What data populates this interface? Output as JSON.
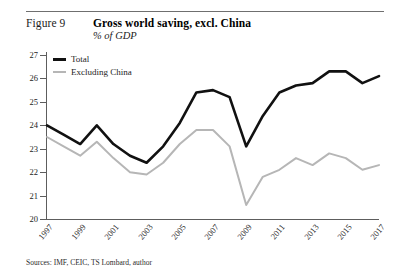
{
  "header": {
    "figure_label": "Figure 9",
    "title": "Gross world saving, excl. China",
    "subtitle": "% of GDP"
  },
  "legend": {
    "position": "top-left",
    "items": [
      {
        "label": "Total",
        "color": "#111111"
      },
      {
        "label": "Excluding China",
        "color": "#b6b6b6"
      }
    ]
  },
  "footer": {
    "source": "Sources: IMF, CEIC, TS Lombard, author"
  },
  "axes": {
    "y_ticks": [
      "27",
      "26",
      "25",
      "24",
      "23",
      "22",
      "21",
      "20"
    ],
    "x_ticks": [
      "1997",
      "1999",
      "2001",
      "2003",
      "2005",
      "2007",
      "2009",
      "2011",
      "2013",
      "2015",
      "2017"
    ]
  },
  "chart_data": {
    "type": "line",
    "title": "Gross world saving, excl. China",
    "subtitle": "% of GDP",
    "xlabel": "",
    "ylabel": "% of GDP",
    "ylim": [
      20,
      27
    ],
    "xlim": [
      1997,
      2017
    ],
    "grid": false,
    "legend_position": "top-left",
    "x": [
      1997,
      1998,
      1999,
      2000,
      2001,
      2002,
      2003,
      2004,
      2005,
      2006,
      2007,
      2008,
      2009,
      2010,
      2011,
      2012,
      2013,
      2014,
      2015,
      2016,
      2017
    ],
    "series": [
      {
        "name": "Total",
        "color": "#111111",
        "values": [
          24.0,
          23.6,
          23.2,
          24.0,
          23.2,
          22.7,
          22.4,
          23.1,
          24.1,
          25.4,
          25.5,
          25.2,
          23.1,
          24.4,
          25.4,
          25.7,
          25.8,
          26.3,
          26.3,
          25.8,
          26.1
        ]
      },
      {
        "name": "Excluding China",
        "color": "#b6b6b6",
        "values": [
          23.5,
          23.1,
          22.7,
          23.3,
          22.6,
          22.0,
          21.9,
          22.4,
          23.2,
          23.8,
          23.8,
          23.1,
          20.6,
          21.8,
          22.1,
          22.6,
          22.3,
          22.8,
          22.6,
          22.1,
          22.3
        ]
      }
    ]
  }
}
